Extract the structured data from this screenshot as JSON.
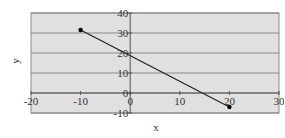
{
  "chart_data": {
    "type": "scatter",
    "title": "",
    "xlabel": "x",
    "ylabel": "y",
    "xlim": [
      -20,
      30
    ],
    "ylim": [
      -10,
      40
    ],
    "x_ticks": [
      -20,
      -10,
      0,
      10,
      20,
      30
    ],
    "y_ticks": [
      -10,
      0,
      10,
      20,
      30,
      40
    ],
    "x_tick_labels": [
      "-20",
      "-10",
      "0",
      "10",
      "20",
      "30"
    ],
    "y_tick_labels": [
      "-10",
      "0",
      "10",
      "20",
      "30",
      "40"
    ],
    "grid": "horizontal",
    "legend": "none",
    "series": [
      {
        "name": "Series 1",
        "mode": "lines+markers",
        "x": [
          -10,
          20
        ],
        "y": [
          31.5,
          -7
        ]
      }
    ]
  },
  "colors": {
    "plot_background": "#e0e0e0",
    "gridline": "#8a8a8a",
    "axis": "#555555",
    "series_line": "#222222",
    "marker": "#000000",
    "text": "#333333"
  }
}
